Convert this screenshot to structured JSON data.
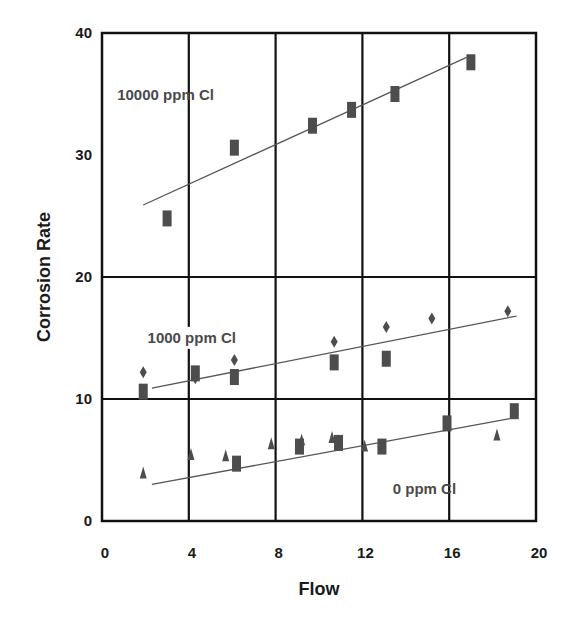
{
  "chart_data": {
    "type": "scatter",
    "title": "",
    "xlabel": "Flow",
    "ylabel": "Corrosion Rate",
    "xlim": [
      0,
      20
    ],
    "ylim": [
      0,
      40
    ],
    "xticks": [
      0,
      4,
      8,
      12,
      16,
      20
    ],
    "yticks": [
      0,
      10,
      20,
      30,
      40
    ],
    "xtick_labels": [
      "0",
      "4",
      "8",
      "12",
      "16",
      "20"
    ],
    "ytick_labels": [
      "0",
      "10",
      "20",
      "30",
      "40"
    ],
    "grid": {
      "vertical_at": [
        4,
        8,
        12,
        16
      ],
      "horizontal_at": [
        10,
        20
      ]
    },
    "legend": "none (inline annotations)",
    "annotations": [
      {
        "text": "10000 ppm Cl",
        "x": 0.7,
        "y": 34.5
      },
      {
        "text": "1000 ppm Cl",
        "x": 2.1,
        "y": 14.6
      },
      {
        "text": "0 ppm Cl",
        "x": 13.4,
        "y": 2.2
      }
    ],
    "series": [
      {
        "name": "10000 ppm Cl",
        "marker": "square",
        "x": [
          3.0,
          6.1,
          9.7,
          11.5,
          13.5,
          17.0
        ],
        "y": [
          24.8,
          30.6,
          32.4,
          33.7,
          35.0,
          37.6
        ],
        "trendline": {
          "x": [
            1.9,
            16.8
          ],
          "y": [
            25.9,
            38.0
          ]
        }
      },
      {
        "name": "1000 ppm Cl (squares)",
        "marker": "square",
        "x": [
          1.9,
          4.3,
          6.1,
          10.7,
          13.1
        ],
        "y": [
          10.6,
          12.1,
          11.8,
          13.0,
          13.3
        ]
      },
      {
        "name": "1000 ppm Cl (diamonds)",
        "marker": "diamond",
        "x": [
          1.9,
          4.3,
          6.1,
          10.7,
          13.1,
          15.2,
          18.7
        ],
        "y": [
          12.2,
          11.7,
          13.2,
          14.7,
          15.9,
          16.6,
          17.2
        ],
        "trendline": {
          "x": [
            2.3,
            19.1
          ],
          "y": [
            10.9,
            16.8
          ]
        }
      },
      {
        "name": "0 ppm Cl (squares)",
        "marker": "square",
        "x": [
          6.2,
          9.1,
          10.9,
          12.9,
          15.9,
          19.0
        ],
        "y": [
          4.7,
          6.1,
          6.4,
          6.1,
          8.0,
          9.0
        ]
      },
      {
        "name": "0 ppm Cl (triangles)",
        "marker": "triangle",
        "x": [
          1.9,
          4.1,
          5.7,
          7.8,
          9.2,
          10.6,
          12.1,
          18.2
        ],
        "y": [
          3.9,
          5.4,
          5.3,
          6.3,
          6.6,
          6.8,
          6.1,
          7.0
        ],
        "trendline": {
          "x": [
            2.3,
            18.8
          ],
          "y": [
            3.0,
            8.4
          ]
        }
      }
    ]
  },
  "colors": {
    "frame": "#111111",
    "trendline": "#555555",
    "marker": "#4d4d4d",
    "label_text": "#4a4a4a"
  }
}
